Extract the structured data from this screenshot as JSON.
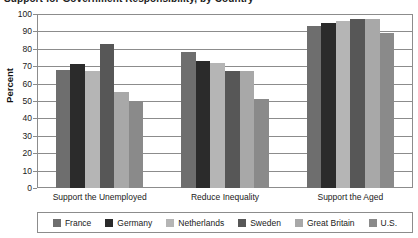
{
  "title": {
    "text": "Support for Government Responsibility, by Country"
  },
  "axis": {
    "ylabel": "Percent",
    "yticks": [
      0,
      10,
      20,
      30,
      40,
      50,
      60,
      70,
      80,
      90,
      100
    ]
  },
  "legend": {
    "items": [
      {
        "label": "France",
        "color": "#6e6e6e"
      },
      {
        "label": "Germany",
        "color": "#2b2b2b"
      },
      {
        "label": "Netherlands",
        "color": "#b5b5b5"
      },
      {
        "label": "Sweden",
        "color": "#575757"
      },
      {
        "label": "Great Britain",
        "color": "#a8a8a8"
      },
      {
        "label": "U.S.",
        "color": "#8a8a8a"
      }
    ]
  },
  "chart_data": {
    "type": "bar",
    "title": "Support for Government Responsibility, by Country",
    "xlabel": "",
    "ylabel": "Percent",
    "ylim": [
      0,
      100
    ],
    "ytick_step": 10,
    "grid": true,
    "legend_position": "bottom",
    "categories": [
      "Support the Unemployed",
      "Reduce Inequality",
      "Support the Aged"
    ],
    "series": [
      {
        "name": "France",
        "color": "#6e6e6e",
        "values": [
          68,
          78,
          93
        ]
      },
      {
        "name": "Germany",
        "color": "#2b2b2b",
        "values": [
          71,
          73,
          95
        ]
      },
      {
        "name": "Netherlands",
        "color": "#b5b5b5",
        "values": [
          67,
          72,
          96
        ]
      },
      {
        "name": "Sweden",
        "color": "#575757",
        "values": [
          83,
          67,
          97
        ]
      },
      {
        "name": "Great Britain",
        "color": "#a8a8a8",
        "values": [
          55,
          67,
          97
        ]
      },
      {
        "name": "U.S.",
        "color": "#8a8a8a",
        "values": [
          50,
          51,
          89
        ]
      }
    ]
  }
}
